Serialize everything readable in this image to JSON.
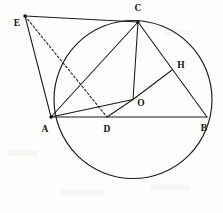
{
  "figure": {
    "background_color": "#fdfdfb",
    "ink_color": "#1a1a1a"
  },
  "chart_data": {
    "type": "diagram",
    "title": "",
    "xlabel": "",
    "ylabel": "",
    "viewbox": [
      0,
      0,
      223,
      213
    ],
    "circle": {
      "name": "circumcircle",
      "center_label": "O",
      "cx": 133,
      "cy": 99.5,
      "r": 79
    },
    "points": [
      {
        "id": "E",
        "label": "E",
        "x": 25,
        "y": 16,
        "label_x": 17,
        "label_y": 24,
        "dot": true,
        "on_circle": false
      },
      {
        "id": "C",
        "label": "C",
        "x": 138,
        "y": 22,
        "label_x": 138,
        "label_y": 9,
        "dot": true,
        "on_circle": true
      },
      {
        "id": "H",
        "label": "H",
        "x": 172,
        "y": 70,
        "label_x": 181,
        "label_y": 66,
        "dot": false,
        "on_circle": false
      },
      {
        "id": "O",
        "label": "O",
        "x": 133,
        "y": 99.5,
        "label_x": 141,
        "label_y": 104,
        "dot": false,
        "on_circle": false
      },
      {
        "id": "A",
        "label": "A",
        "x": 51,
        "y": 117,
        "label_x": 45,
        "label_y": 130,
        "dot": true,
        "on_circle": true
      },
      {
        "id": "D",
        "label": "D",
        "x": 107,
        "y": 117,
        "label_x": 107,
        "label_y": 130,
        "dot": false,
        "on_circle": false
      },
      {
        "id": "B",
        "label": "B",
        "x": 207,
        "y": 117,
        "label_x": 204,
        "label_y": 129,
        "dot": false,
        "on_circle": true
      }
    ],
    "segments": [
      {
        "name": "segment-EC",
        "from": "E",
        "to": "C",
        "style": "solid"
      },
      {
        "name": "segment-EA",
        "from": "E",
        "to": "A",
        "style": "solid"
      },
      {
        "name": "segment-ED",
        "from": "E",
        "to": "D",
        "style": "dashed"
      },
      {
        "name": "segment-AC",
        "from": "A",
        "to": "C",
        "style": "solid"
      },
      {
        "name": "segment-AB",
        "from": "A",
        "to": "B",
        "style": "solid"
      },
      {
        "name": "segment-AO",
        "from": "A",
        "to": "O",
        "style": "solid"
      },
      {
        "name": "segment-CO",
        "from": "C",
        "to": "O",
        "style": "solid"
      },
      {
        "name": "segment-CB",
        "from": "C",
        "to": "B",
        "style": "solid"
      },
      {
        "name": "segment-OD",
        "from": "O",
        "to": "D",
        "style": "solid"
      },
      {
        "name": "segment-OH",
        "from": "O",
        "to": "H",
        "style": "solid"
      }
    ],
    "labels": [
      "E",
      "C",
      "H",
      "O",
      "A",
      "D",
      "B"
    ]
  }
}
